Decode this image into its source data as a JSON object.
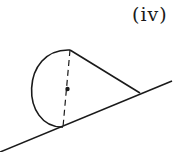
{
  "figure": {
    "label": "(iv)",
    "colors": {
      "stroke": "#1a1a1a",
      "background": "#ffffff"
    }
  }
}
